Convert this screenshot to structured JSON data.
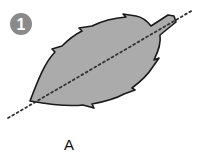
{
  "figure": {
    "step_number": "1",
    "label": "A",
    "colors": {
      "badge": "#8a8a8a",
      "badge_text": "#ffffff",
      "leaf_fill": "#ababab",
      "leaf_outline": "#1a1a1a",
      "midrib_line": "#333333",
      "background": "#ffffff"
    }
  }
}
